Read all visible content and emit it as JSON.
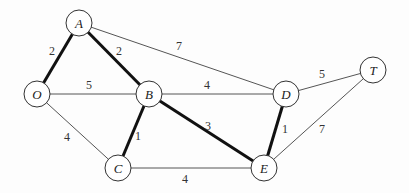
{
  "graph": {
    "type": "weighted-undirected-graph",
    "nodes": [
      {
        "id": "A",
        "label": "A",
        "x": 79,
        "y": 23
      },
      {
        "id": "O",
        "label": "O",
        "x": 37,
        "y": 94
      },
      {
        "id": "B",
        "label": "B",
        "x": 149,
        "y": 94
      },
      {
        "id": "D",
        "label": "D",
        "x": 286,
        "y": 94
      },
      {
        "id": "T",
        "label": "T",
        "x": 373,
        "y": 70
      },
      {
        "id": "C",
        "label": "C",
        "x": 118,
        "y": 168
      },
      {
        "id": "E",
        "label": "E",
        "x": 264,
        "y": 168
      }
    ],
    "edges": [
      {
        "from": "O",
        "to": "A",
        "weight": "2",
        "bold": true,
        "lx": 52,
        "ly": 55
      },
      {
        "from": "A",
        "to": "B",
        "weight": "2",
        "bold": true,
        "lx": 119,
        "ly": 55
      },
      {
        "from": "A",
        "to": "D",
        "weight": "7",
        "bold": false,
        "lx": 179,
        "ly": 50
      },
      {
        "from": "O",
        "to": "B",
        "weight": "5",
        "bold": false,
        "lx": 89,
        "ly": 89
      },
      {
        "from": "B",
        "to": "D",
        "weight": "4",
        "bold": false,
        "lx": 207,
        "ly": 89
      },
      {
        "from": "D",
        "to": "T",
        "weight": "5",
        "bold": false,
        "lx": 322,
        "ly": 78
      },
      {
        "from": "O",
        "to": "C",
        "weight": "4",
        "bold": false,
        "lx": 67,
        "ly": 141
      },
      {
        "from": "B",
        "to": "C",
        "weight": "1",
        "bold": true,
        "lx": 138,
        "ly": 140
      },
      {
        "from": "B",
        "to": "E",
        "weight": "3",
        "bold": true,
        "lx": 208,
        "ly": 130
      },
      {
        "from": "D",
        "to": "E",
        "weight": "1",
        "bold": true,
        "lx": 285,
        "ly": 133
      },
      {
        "from": "T",
        "to": "E",
        "weight": "7",
        "bold": false,
        "lx": 322,
        "ly": 133
      },
      {
        "from": "C",
        "to": "E",
        "weight": "4",
        "bold": false,
        "lx": 185,
        "ly": 183
      }
    ],
    "colors": {
      "edge": "#555555",
      "bold_edge": "#111111",
      "node_stroke": "#333333",
      "node_fill": "#ffffff"
    }
  }
}
